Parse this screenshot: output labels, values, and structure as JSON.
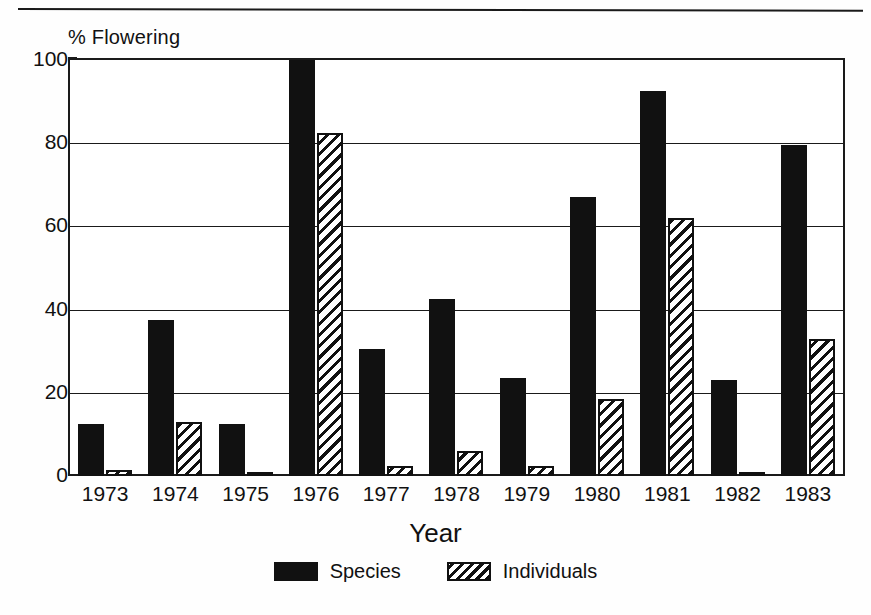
{
  "figure": {
    "y_axis_title": "% Flowering",
    "x_axis_title": "Year",
    "top_rule": "horizontal-rule"
  },
  "legend": {
    "entries": [
      {
        "label": "Species",
        "swatch": "solid-black-swatch",
        "color": "#111111"
      },
      {
        "label": "Individuals",
        "swatch": "diagonal-hatch-swatch",
        "color": "#111111"
      }
    ]
  },
  "y_axis": {
    "ticks": [
      "0",
      "20",
      "40",
      "60",
      "80",
      "100"
    ],
    "values": [
      0,
      20,
      40,
      60,
      80,
      100
    ]
  },
  "chart_data": {
    "type": "bar",
    "title": "",
    "xlabel": "Year",
    "ylabel": "% Flowering",
    "ylim": [
      0,
      100
    ],
    "yticks": [
      0,
      20,
      40,
      60,
      80,
      100
    ],
    "grid": "horizontal",
    "legend_position": "bottom-center",
    "categories": [
      "1973",
      "1974",
      "1975",
      "1976",
      "1977",
      "1978",
      "1979",
      "1980",
      "1981",
      "1982",
      "1983"
    ],
    "series": [
      {
        "name": "Species",
        "fill": "solid-black",
        "values": [
          12.5,
          37.5,
          12.5,
          100,
          30.5,
          42.5,
          23.5,
          67,
          92.5,
          23,
          79.5
        ]
      },
      {
        "name": "Individuals",
        "fill": "diagonal-hatch",
        "values": [
          1.5,
          13,
          0.5,
          82.5,
          2.5,
          6,
          2.5,
          18.5,
          62,
          1,
          33
        ]
      }
    ]
  }
}
